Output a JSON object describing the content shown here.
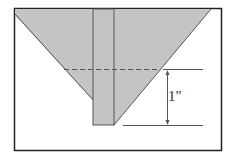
{
  "diagram": {
    "dimension_label": "1\"",
    "colors": {
      "fill": "#c4c4c4",
      "stroke": "#333333",
      "frame": "#222222"
    }
  }
}
